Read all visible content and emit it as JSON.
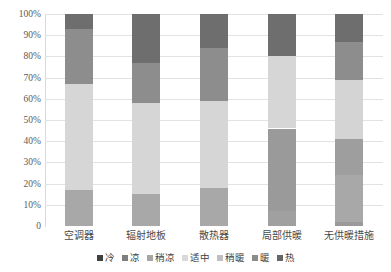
{
  "chart_data": {
    "type": "bar",
    "subtype": "stacked-percentage-column",
    "title": "",
    "xlabel": "",
    "ylabel": "",
    "ylim": [
      0,
      100
    ],
    "grid": true,
    "legend_position": "bottom",
    "categories": [
      "空调器",
      "辐射地板",
      "散热器",
      "局部供暖",
      "无供暖措施"
    ],
    "ytick_labels": [
      "0",
      "10%",
      "20%",
      "30%",
      "40%",
      "50%",
      "60%",
      "70%",
      "80%",
      "90%",
      "100%"
    ],
    "ytick_values": [
      0,
      10,
      20,
      30,
      40,
      50,
      60,
      70,
      80,
      90,
      100
    ],
    "series": [
      {
        "name": "冷",
        "color": "#404040",
        "values": [
          0,
          0,
          0,
          0,
          0
        ]
      },
      {
        "name": "凉",
        "color": "#7f7f7f",
        "values": [
          0,
          0,
          0,
          0,
          0
        ]
      },
      {
        "name": "稍凉",
        "color": "#a6a6a6",
        "values": [
          17,
          15,
          18,
          7,
          2
        ]
      },
      {
        "name": "适中",
        "color": "#d9d9d9",
        "values": [
          50,
          43,
          41,
          39,
          22
        ]
      },
      {
        "name": "稍暖",
        "color": "#bfbfbf",
        "values": [
          0,
          0,
          0,
          34,
          17
        ]
      },
      {
        "name": "暖",
        "color": "#8c8c8c",
        "values": [
          26,
          19,
          25,
          0,
          28
        ]
      },
      {
        "name": "热",
        "color": "#666666",
        "values": [
          7,
          23,
          16,
          20,
          31
        ]
      }
    ],
    "stacks": [
      {
        "category": "空调器",
        "segments": [
          {
            "name": "稍凉",
            "value": 17,
            "color": "#a8a8a8"
          },
          {
            "name": "适中",
            "value": 50,
            "color": "#d6d6d6"
          },
          {
            "name": "暖",
            "value": 26,
            "color": "#8d8d8d"
          },
          {
            "name": "热",
            "value": 7,
            "color": "#6e6e6e"
          }
        ]
      },
      {
        "category": "辐射地板",
        "segments": [
          {
            "name": "稍凉",
            "value": 15,
            "color": "#a8a8a8"
          },
          {
            "name": "适中",
            "value": 43,
            "color": "#d6d6d6"
          },
          {
            "name": "暖",
            "value": 19,
            "color": "#8d8d8d"
          },
          {
            "name": "热",
            "value": 23,
            "color": "#6e6e6e"
          }
        ]
      },
      {
        "category": "散热器",
        "segments": [
          {
            "name": "稍凉",
            "value": 18,
            "color": "#a8a8a8"
          },
          {
            "name": "适中",
            "value": 41,
            "color": "#d6d6d6"
          },
          {
            "name": "暖",
            "value": 25,
            "color": "#8d8d8d"
          },
          {
            "name": "热",
            "value": 16,
            "color": "#6e6e6e"
          }
        ]
      },
      {
        "category": "局部供暖",
        "segments": [
          {
            "name": "稍凉",
            "value": 7,
            "color": "#a0a0a0"
          },
          {
            "name": "暖",
            "value": 39,
            "color": "#9a9a9a"
          },
          {
            "name": "适中",
            "value": 34,
            "color": "#d6d6d6"
          },
          {
            "name": "热",
            "value": 20,
            "color": "#6e6e6e"
          }
        ]
      },
      {
        "category": "无供暖措施",
        "segments": [
          {
            "name": "稍凉",
            "value": 2,
            "color": "#9a9a9a"
          },
          {
            "name": "稍暖",
            "value": 22,
            "color": "#a8a8a8"
          },
          {
            "name": "暖",
            "value": 17,
            "color": "#9e9e9e"
          },
          {
            "name": "适中",
            "value": 28,
            "color": "#d4d4d4"
          },
          {
            "name": "热1",
            "value": 18,
            "color": "#8d8d8d"
          },
          {
            "name": "热2",
            "value": 13,
            "color": "#6e6e6e"
          }
        ]
      }
    ]
  },
  "legend": {
    "items": [
      {
        "label": "冷",
        "color": "#404040"
      },
      {
        "label": "凉",
        "color": "#7f7f7f"
      },
      {
        "label": "稍凉",
        "color": "#a6a6a6"
      },
      {
        "label": "适中",
        "color": "#d9d9d9"
      },
      {
        "label": "稍暖",
        "color": "#bfbfbf"
      },
      {
        "label": "暖",
        "color": "#8c8c8c"
      },
      {
        "label": "热",
        "color": "#666666"
      }
    ]
  }
}
